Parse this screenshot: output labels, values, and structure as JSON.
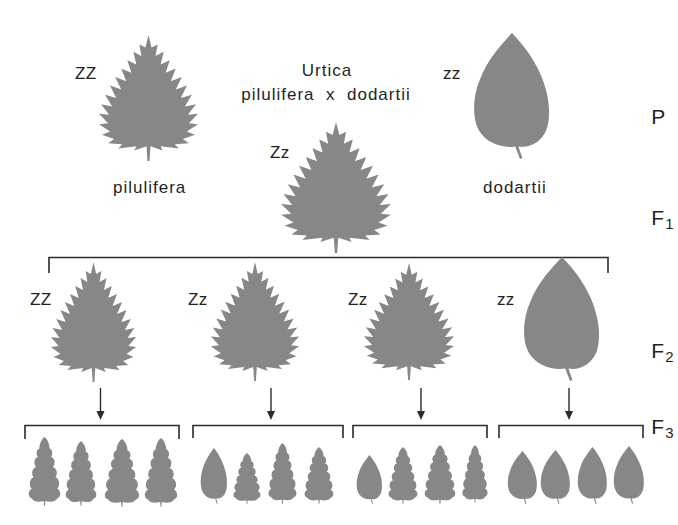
{
  "title": {
    "line1": "Urtica",
    "line2": "pilulifera  x  dodartii"
  },
  "generation_labels": [
    {
      "letter": "P",
      "sub": ""
    },
    {
      "letter": "F",
      "sub": "1"
    },
    {
      "letter": "F",
      "sub": "2"
    },
    {
      "letter": "F",
      "sub": "3"
    }
  ],
  "parents": [
    {
      "species": "pilulifera",
      "genotype": "ZZ",
      "leaf_shape": "serrate"
    },
    {
      "species": "dodartii",
      "genotype": "zz",
      "leaf_shape": "ovate"
    }
  ],
  "f1": {
    "genotype": "Zz",
    "leaf_shape": "serrate"
  },
  "f2": [
    {
      "genotype": "ZZ",
      "leaf_shape": "serrate"
    },
    {
      "genotype": "Zz",
      "leaf_shape": "serrate"
    },
    {
      "genotype": "Zz",
      "leaf_shape": "serrate"
    },
    {
      "genotype": "zz",
      "leaf_shape": "ovate"
    }
  ],
  "f3": [
    {
      "leaves": [
        "lobed",
        "lobed",
        "lobed",
        "lobed"
      ]
    },
    {
      "leaves": [
        "ovate",
        "lobed",
        "lobed",
        "lobed"
      ]
    },
    {
      "leaves": [
        "ovate",
        "lobed",
        "lobed",
        "lobed"
      ]
    },
    {
      "leaves": [
        "ovate",
        "ovate",
        "ovate",
        "ovate"
      ]
    }
  ],
  "colors": {
    "leaf": "#878787",
    "line": "#2b2b2b",
    "text": "#1f1f1f"
  }
}
